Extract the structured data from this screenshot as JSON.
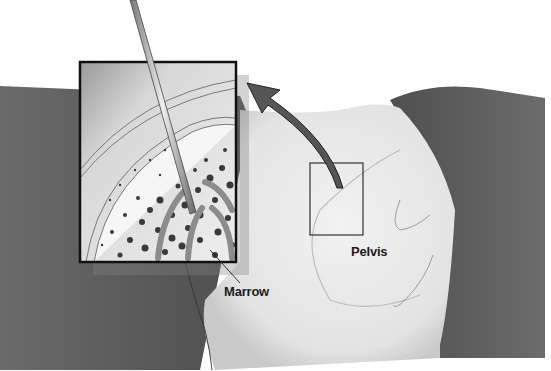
{
  "diagram": {
    "labels": {
      "marrow": "Marrow",
      "pelvis": "Pelvis"
    },
    "colors": {
      "background": "#ffffff",
      "skin_dark": "#5a5a5a",
      "skin_light": "#e6e6e6",
      "arrow": "#555555",
      "marrow_dots": "#3a3a3a",
      "inset_border": "#111111"
    }
  }
}
